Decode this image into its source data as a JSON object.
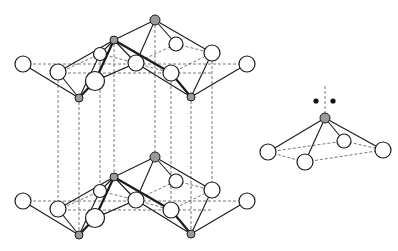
{
  "figure": {
    "title": "",
    "description": "Layered crystal structure: two stacked puckered layers of square-pyramidal units connected by vertical dashed lines, plus an isolated square pyramid with lone pair",
    "colors": {
      "bond": "#1a1a1a",
      "dashed": "#555555",
      "ligand_atom_fill": "#ffffff",
      "central_atom_fill": "#9a9a9a",
      "lone_pair": "#111111"
    }
  },
  "layers": [
    {
      "name": "top-layer",
      "y_offset": 0
    },
    {
      "name": "bottom-layer",
      "y_offset": 137
    }
  ],
  "isolated_unit": {
    "name": "square-pyramid-with-lone-pair",
    "central_atom": "gray",
    "ligands": 4,
    "lone_pair_dots": 2
  }
}
